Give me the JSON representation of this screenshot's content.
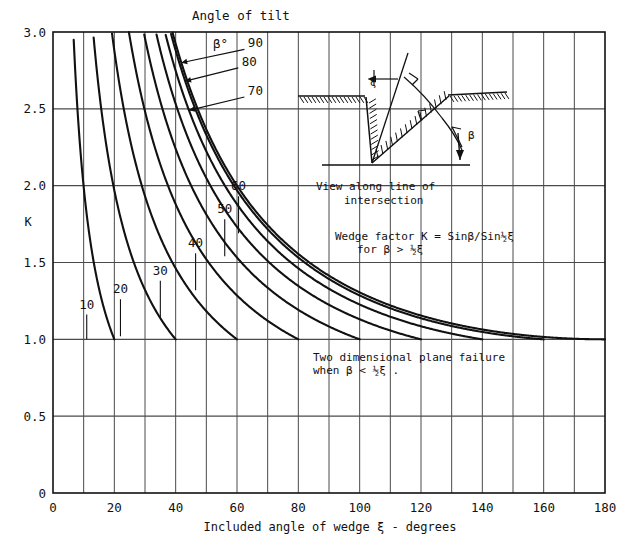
{
  "figure": {
    "title_header": "Angle of tilt",
    "beta_symbol_label": "β°",
    "y_axis_label": "K",
    "x_axis_label": "Included angle of wedge ξ - degrees",
    "note_formula_line1": "Wedge factor K = Sinβ/Sin½ξ",
    "note_formula_line2": "for β > ½ξ",
    "note_plane_line1": "Two dimensional plane failure",
    "note_plane_line2": "when β < ½ξ .",
    "inset_caption_line1": "View along line of",
    "inset_caption_line2": "intersection",
    "inset_label_xi": "ξ",
    "inset_label_beta": "β",
    "line_color": "#111111",
    "grid_color": "#4a4a4a",
    "background_color": "#ffffff"
  },
  "chart_data": {
    "type": "line",
    "xlabel": "Included angle of wedge ξ - degrees",
    "ylabel": "K",
    "xlim": [
      0,
      180
    ],
    "ylim": [
      0,
      3.0
    ],
    "xticks": [
      0,
      20,
      40,
      60,
      80,
      100,
      120,
      140,
      160,
      180
    ],
    "yticks": [
      0,
      0.5,
      1.0,
      1.5,
      2.0,
      2.5,
      3.0
    ],
    "xtick_labels": [
      "0",
      "20",
      "40",
      "60",
      "80",
      "100",
      "120",
      "140",
      "160",
      "180"
    ],
    "ytick_labels": [
      "0",
      "0.5",
      "1.0",
      "1.5",
      "2.0",
      "2.5",
      "3.0"
    ],
    "x_minor_step": 10,
    "grid": true,
    "legend": "inline curve labels",
    "formula": "K = sin(beta) / sin(xi/2)",
    "valid_when": "beta > xi/2",
    "series": [
      {
        "name": "10",
        "beta_deg": 10,
        "label": "10",
        "label_x": 11.0,
        "label_y": 1.2,
        "end_x": 20,
        "end_y": 1.0
      },
      {
        "name": "20",
        "beta_deg": 20,
        "label": "20",
        "label_x": 22.0,
        "label_y": 1.3,
        "end_x": 40,
        "end_y": 1.0
      },
      {
        "name": "30",
        "beta_deg": 30,
        "label": "30",
        "label_x": 35.0,
        "label_y": 1.42,
        "end_x": 60,
        "end_y": 1.0
      },
      {
        "name": "40",
        "beta_deg": 40,
        "label": "40",
        "label_x": 46.5,
        "label_y": 1.6,
        "end_x": 80,
        "end_y": 1.0
      },
      {
        "name": "50",
        "beta_deg": 50,
        "label": "50",
        "label_x": 56.0,
        "label_y": 1.82,
        "end_x": 100,
        "end_y": 1.0
      },
      {
        "name": "60",
        "beta_deg": 60,
        "label": "60",
        "label_x": 60.5,
        "label_y": 1.97,
        "end_x": 120,
        "end_y": 1.0
      },
      {
        "name": "70",
        "beta_deg": 70,
        "label": "70",
        "label_x": 66.0,
        "label_y": 2.59,
        "end_x": 140,
        "end_y": 1.0
      },
      {
        "name": "80",
        "beta_deg": 80,
        "label": "80",
        "label_x": 64.0,
        "label_y": 2.78,
        "end_x": 160,
        "end_y": 1.0
      },
      {
        "name": "90",
        "beta_deg": 90,
        "label": "90",
        "label_x": 66.0,
        "label_y": 2.9,
        "end_x": 180,
        "end_y": 1.0
      }
    ],
    "annotations": [
      {
        "text": "Angle of tilt",
        "x": 60,
        "y": 3.06
      },
      {
        "text": "β°",
        "x": 62,
        "y": 2.95
      },
      {
        "text": "Wedge factor K = Sinβ/Sin½ξ",
        "x": 92,
        "y": 1.78
      },
      {
        "text": "for β > ½ξ",
        "x": 98,
        "y": 1.7
      },
      {
        "text": "Two dimensional plane failure",
        "x": 88,
        "y": 0.89
      },
      {
        "text": "when β < ½ξ .",
        "x": 88,
        "y": 0.82
      }
    ]
  }
}
